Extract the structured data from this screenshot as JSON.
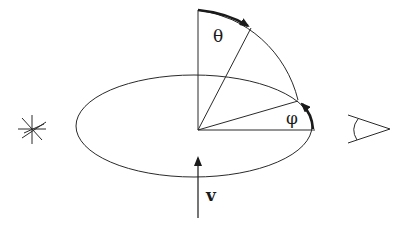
{
  "diagram": {
    "labels": {
      "theta": "θ",
      "phi": "φ",
      "velocity": "v"
    },
    "elements": {
      "source": "star-icon",
      "observer": "eye-icon",
      "orbit": "ellipse",
      "velocity_arrow": "arrow-up"
    },
    "colors": {
      "stroke": "#2a2a2a",
      "background": "#ffffff"
    }
  }
}
